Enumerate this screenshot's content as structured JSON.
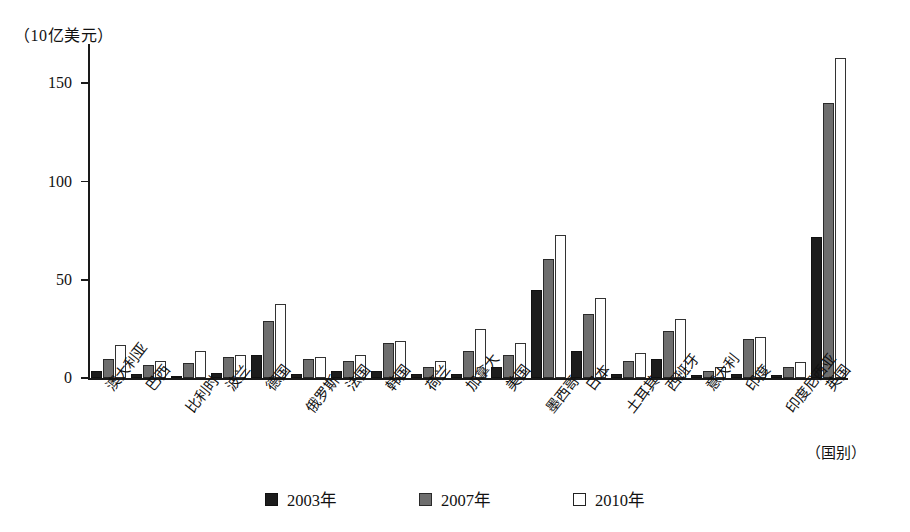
{
  "axis": {
    "y_unit_label": "（10亿美元）",
    "x_axis_title": "（国别）",
    "y_ticks": [
      "0",
      "50",
      "100",
      "150"
    ]
  },
  "legend": {
    "items": [
      {
        "label": "2003年",
        "swatch": "black-filled-square-icon",
        "color": "#1c1c1c"
      },
      {
        "label": "2007年",
        "swatch": "gray-filled-square-icon",
        "color": "#6e6e6e"
      },
      {
        "label": "2010年",
        "swatch": "white-outline-square-icon",
        "color": "#ffffff"
      }
    ]
  },
  "chart_data": {
    "type": "bar",
    "title": "",
    "subtitle": "",
    "xlabel": "（国别）",
    "ylabel": "（10亿美元）",
    "ylim": [
      0,
      170
    ],
    "yticks": [
      0,
      50,
      100,
      150
    ],
    "grid": false,
    "legend_position": "bottom",
    "categories": [
      "澳大利亚",
      "巴西",
      "比利时",
      "波兰",
      "德国",
      "俄罗斯",
      "法国",
      "韩国",
      "荷兰",
      "加拿大",
      "美国",
      "墨西哥",
      "日本",
      "土耳其",
      "西班牙",
      "意大利",
      "印度",
      "印度尼西亚",
      "英国"
    ],
    "series": [
      {
        "name": "2003年",
        "color": "#1c1c1c",
        "values": [
          4,
          2,
          1,
          3,
          12,
          2,
          4,
          4,
          2,
          2,
          6,
          45,
          14,
          2,
          10,
          1.5,
          2,
          1.5,
          72
        ]
      },
      {
        "name": "2007年",
        "color": "#6e6e6e",
        "values": [
          10,
          7,
          8,
          11,
          29,
          10,
          9,
          18,
          6,
          14,
          12,
          61,
          33,
          9,
          24,
          4,
          20,
          6,
          140
        ]
      },
      {
        "name": "2010年",
        "color": "#ffffff",
        "values": [
          17,
          9,
          14,
          12,
          38,
          11,
          12,
          19,
          9,
          25,
          18,
          73,
          41,
          13,
          30,
          6,
          21,
          8.5,
          163
        ]
      }
    ]
  }
}
